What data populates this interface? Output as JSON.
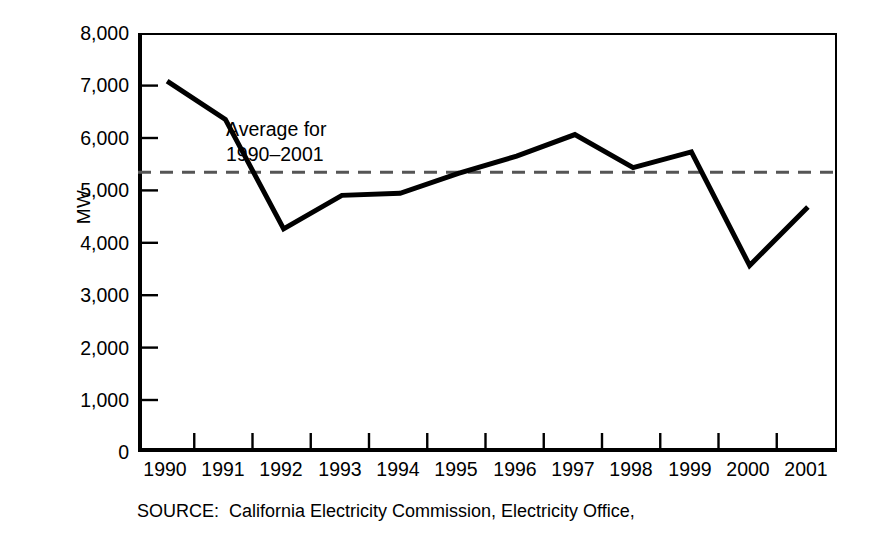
{
  "chart_data": {
    "type": "line",
    "title": "",
    "subtitle": "",
    "xlabel": "",
    "ylabel": "MW",
    "categories": [
      "1990",
      "1991",
      "1992",
      "1993",
      "1994",
      "1995",
      "1996",
      "1997",
      "1998",
      "1999",
      "2000",
      "2001"
    ],
    "x": [
      1990,
      1991,
      1992,
      1993,
      1994,
      1995,
      1996,
      1997,
      1998,
      1999,
      2000,
      2001
    ],
    "series": [
      {
        "name": "Peak demand",
        "values": [
          7080,
          6350,
          4260,
          4900,
          4940,
          5320,
          5650,
          6060,
          5430,
          5730,
          3560,
          4680
        ],
        "style": "solid",
        "color": "#000000",
        "width": 5
      },
      {
        "name": "Average for 1990-2001",
        "values": [
          5340,
          5340,
          5340,
          5340,
          5340,
          5340,
          5340,
          5340,
          5340,
          5340,
          5340,
          5340
        ],
        "style": "dashed",
        "color": "#555555",
        "width": 3
      }
    ],
    "average_value": 5340,
    "ylim": [
      0,
      8000
    ],
    "ytick_values": [
      0,
      1000,
      2000,
      3000,
      4000,
      5000,
      6000,
      7000,
      8000
    ],
    "ytick_labels": [
      "0",
      "1,000",
      "2,000",
      "3,000",
      "4,000",
      "5,000",
      "6,000",
      "7,000",
      "8,000"
    ],
    "grid": false,
    "legend_position": "none",
    "annotations": [
      {
        "text_line1": "Average for",
        "text_line2": "1990–2001",
        "x": 1992.9,
        "y": 6150
      }
    ]
  },
  "axes": {
    "y_title": "MW",
    "y_tick_labels": [
      "8,000",
      "7,000",
      "6,000",
      "5,000",
      "4,000",
      "3,000",
      "2,000",
      "1,000",
      "0"
    ],
    "x_tick_labels": [
      "1990",
      "1991",
      "1992",
      "1993",
      "1994",
      "1995",
      "1996",
      "1997",
      "1998",
      "1999",
      "2000",
      "2001"
    ]
  },
  "annotation": {
    "line1": "Average for",
    "line2": "1990–2001"
  },
  "source": {
    "label": "SOURCE:",
    "text": "California Electricity Commission, Electricity Office,"
  },
  "colors": {
    "data_line": "#000000",
    "average_line": "#555555",
    "axis": "#000000",
    "background": "#ffffff"
  }
}
